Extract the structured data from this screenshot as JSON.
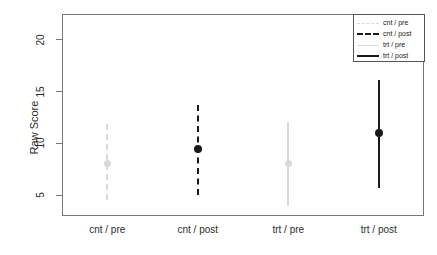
{
  "chart_data": {
    "type": "scatter",
    "title": "",
    "xlabel": "",
    "ylabel": "Raw Score",
    "categories": [
      "cnt / pre",
      "cnt / post",
      "trt / pre",
      "trt / post"
    ],
    "ylim": [
      3.0,
      22.5
    ],
    "yticks": [
      5,
      10,
      15,
      20
    ],
    "ytick_labels": [
      "5",
      "10",
      "15",
      "20"
    ],
    "grid": false,
    "legend_position": "top-right",
    "series": [
      {
        "name": "cnt / pre",
        "category": "cnt / pre",
        "mean": 8.1,
        "lower": 4.5,
        "upper": 11.9,
        "color": "#d9d9d9",
        "linestyle": "dashed"
      },
      {
        "name": "cnt / post",
        "category": "cnt / post",
        "mean": 9.5,
        "lower": 5.0,
        "upper": 13.7,
        "color": "#1a1a1a",
        "linestyle": "dashed"
      },
      {
        "name": "trt / pre",
        "category": "trt / pre",
        "mean": 8.1,
        "lower": 4.0,
        "upper": 12.1,
        "color": "#d9d9d9",
        "linestyle": "solid"
      },
      {
        "name": "trt / post",
        "category": "trt / post",
        "mean": 11.0,
        "lower": 5.7,
        "upper": 16.1,
        "color": "#1a1a1a",
        "linestyle": "solid"
      }
    ]
  },
  "axes": {
    "y_title": "Raw Score",
    "y_tick_labels": [
      "20",
      "15",
      "10",
      "5"
    ],
    "x_tick_labels": [
      "cnt / pre",
      "cnt / post",
      "trt / pre",
      "trt / post"
    ]
  },
  "legend": {
    "entries": [
      {
        "label": "cnt / pre",
        "color": "#d9d9d9",
        "linestyle": "dashed"
      },
      {
        "label": "cnt / post",
        "color": "#1a1a1a",
        "linestyle": "dashed"
      },
      {
        "label": "trt / pre",
        "color": "#d9d9d9",
        "linestyle": "solid"
      },
      {
        "label": "trt / post",
        "color": "#1a1a1a",
        "linestyle": "solid"
      }
    ]
  },
  "colors": {
    "axis": "#777777",
    "text": "#2b2b2b",
    "background": "#ffffff",
    "light_series": "#d9d9d9",
    "dark_series": "#1a1a1a"
  }
}
